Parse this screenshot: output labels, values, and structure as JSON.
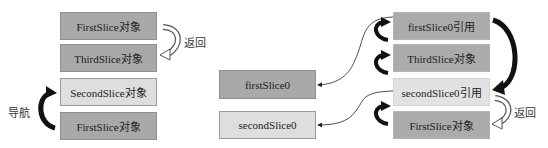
{
  "left_stack": {
    "boxes": [
      {
        "label": "FirstSlice对象",
        "shade": "dark"
      },
      {
        "label": "ThirdSlice对象",
        "shade": "dark"
      },
      {
        "label": "SecondSlice对象",
        "shade": "light"
      },
      {
        "label": "FirstSlice对象",
        "shade": "dark"
      }
    ],
    "return_label": "返回",
    "navigate_label": "导航"
  },
  "variables": [
    {
      "label": "firstSlice0",
      "shade": "dark"
    },
    {
      "label": "secondSlice0",
      "shade": "light"
    }
  ],
  "right_stack": {
    "boxes": [
      {
        "label": "firstSlice0引用",
        "shade": "dark"
      },
      {
        "label": "ThirdSlice对象",
        "shade": "dark"
      },
      {
        "label": "secondSlice0引用",
        "shade": "light"
      },
      {
        "label": "FirstSlice对象",
        "shade": "dark"
      }
    ],
    "return_label": "返回"
  },
  "colors": {
    "dark_box": "#a9a9a9",
    "light_box": "#dedede",
    "arrow": "#111111"
  }
}
